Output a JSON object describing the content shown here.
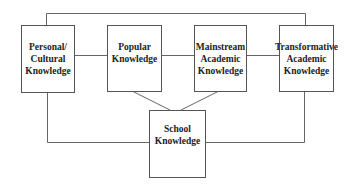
{
  "diagram": {
    "boxes": [
      {
        "id": "personal",
        "label": "Personal/\nCultural\nKnowledge"
      },
      {
        "id": "popular",
        "label": "Popular\nKnowledge"
      },
      {
        "id": "mainstream",
        "label": "Mainstream\nAcademic\nKnowledge"
      },
      {
        "id": "transformative",
        "label": "Transformative\nAcademic\nKnowledge"
      },
      {
        "id": "school",
        "label": "School\nKnowledge"
      }
    ],
    "connections": [
      {
        "from": "personal",
        "to": "popular"
      },
      {
        "from": "popular",
        "to": "mainstream"
      },
      {
        "from": "mainstream",
        "to": "transformative"
      },
      {
        "from": "personal",
        "to": "transformative",
        "route": "top"
      },
      {
        "from": "popular",
        "to": "school"
      },
      {
        "from": "mainstream",
        "to": "school"
      },
      {
        "from": "personal",
        "to": "school",
        "route": "bottom"
      },
      {
        "from": "transformative",
        "to": "school",
        "route": "bottom"
      }
    ],
    "line_color": "#666666"
  }
}
